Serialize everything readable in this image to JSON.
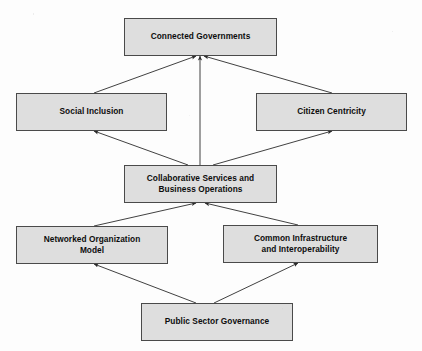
{
  "diagram": {
    "background_color": "#fdfdfd",
    "node_fill_color": "#dedede",
    "node_border_color": "#4a4a4a",
    "edge_color": "#2b2b2b",
    "nodes": [
      {
        "id": "connected-governments",
        "label": "Connected Governments",
        "x": 124,
        "y": 18,
        "w": 153,
        "h": 38,
        "level": "outcome"
      },
      {
        "id": "social-inclusion",
        "label": "Social Inclusion",
        "x": 16,
        "y": 93,
        "w": 151,
        "h": 38,
        "level": "pillar"
      },
      {
        "id": "citizen-centricity",
        "label": "Citizen Centricity",
        "x": 256,
        "y": 93,
        "w": 151,
        "h": 38,
        "level": "pillar"
      },
      {
        "id": "collaborative-services",
        "label": "Collaborative Services and\nBusiness Operations",
        "x": 124,
        "y": 165,
        "w": 153,
        "h": 38,
        "level": "core"
      },
      {
        "id": "networked-organization-model",
        "label": "Networked Organization\nModel",
        "x": 16,
        "y": 226,
        "w": 152,
        "h": 38,
        "level": "enabler"
      },
      {
        "id": "common-infrastructure",
        "label": "Common Infrastructure\nand Interoperability",
        "x": 223,
        "y": 225,
        "w": 155,
        "h": 38,
        "level": "enabler"
      },
      {
        "id": "public-sector-governance",
        "label": "Public Sector Governance",
        "x": 141,
        "y": 303,
        "w": 152,
        "h": 38,
        "level": "foundation"
      }
    ],
    "edges": [
      {
        "id": "social-to-connected",
        "from": "social-inclusion",
        "to": "connected-governments",
        "x1": 94,
        "y1": 93,
        "x2": 196,
        "y2": 56
      },
      {
        "id": "citizen-to-connected",
        "from": "citizen-centricity",
        "to": "connected-governments",
        "x1": 332,
        "y1": 93,
        "x2": 204,
        "y2": 56
      },
      {
        "id": "collaborative-to-connected",
        "from": "collaborative-services",
        "to": "connected-governments",
        "x1": 200,
        "y1": 165,
        "x2": 200,
        "y2": 56
      },
      {
        "id": "collaborative-to-social",
        "from": "collaborative-services",
        "to": "social-inclusion",
        "x1": 188,
        "y1": 165,
        "x2": 94,
        "y2": 131
      },
      {
        "id": "collaborative-to-citizen",
        "from": "collaborative-services",
        "to": "citizen-centricity",
        "x1": 213,
        "y1": 165,
        "x2": 332,
        "y2": 131
      },
      {
        "id": "networked-to-collaborative",
        "from": "networked-organization-model",
        "to": "collaborative-services",
        "x1": 94,
        "y1": 226,
        "x2": 196,
        "y2": 203
      },
      {
        "id": "infrastructure-to-collab",
        "from": "common-infrastructure",
        "to": "collaborative-services",
        "x1": 298,
        "y1": 225,
        "x2": 205,
        "y2": 203
      },
      {
        "id": "governance-to-networked",
        "from": "public-sector-governance",
        "to": "networked-organization-model",
        "x1": 196,
        "y1": 303,
        "x2": 94,
        "y2": 264
      },
      {
        "id": "governance-to-infra",
        "from": "public-sector-governance",
        "to": "common-infrastructure",
        "x1": 214,
        "y1": 303,
        "x2": 298,
        "y2": 263
      }
    ]
  }
}
